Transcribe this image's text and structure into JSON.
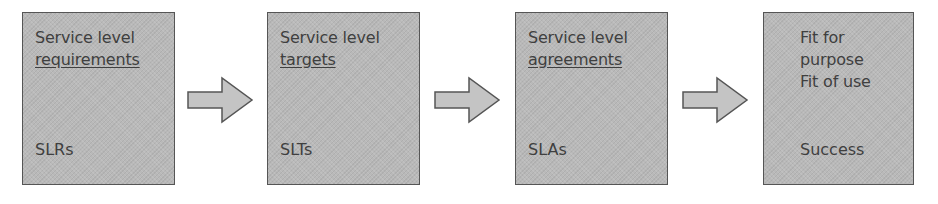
{
  "diagram": {
    "type": "flow",
    "colors": {
      "box_fill": "#b9b9b9",
      "box_border": "#555555",
      "arrow_fill": "#c4c4c4",
      "arrow_border": "#555555",
      "text": "#3f3f3f"
    },
    "steps": [
      {
        "line1": "Service level",
        "line2": "requirements",
        "line2_underlined": true,
        "abbr": "SLRs"
      },
      {
        "line1": "Service level",
        "line2": "targets",
        "line2_underlined": true,
        "abbr": "SLTs"
      },
      {
        "line1": "Service level",
        "line2": "agreements",
        "line2_underlined": true,
        "abbr": "SLAs"
      },
      {
        "line1": "Fit for",
        "line2": "purpose",
        "line3": "Fit of use",
        "abbr": "Success"
      }
    ],
    "arrows": [
      {
        "from": 0,
        "to": 1,
        "direction": "right"
      },
      {
        "from": 1,
        "to": 2,
        "direction": "right"
      },
      {
        "from": 2,
        "to": 3,
        "direction": "right"
      }
    ]
  }
}
